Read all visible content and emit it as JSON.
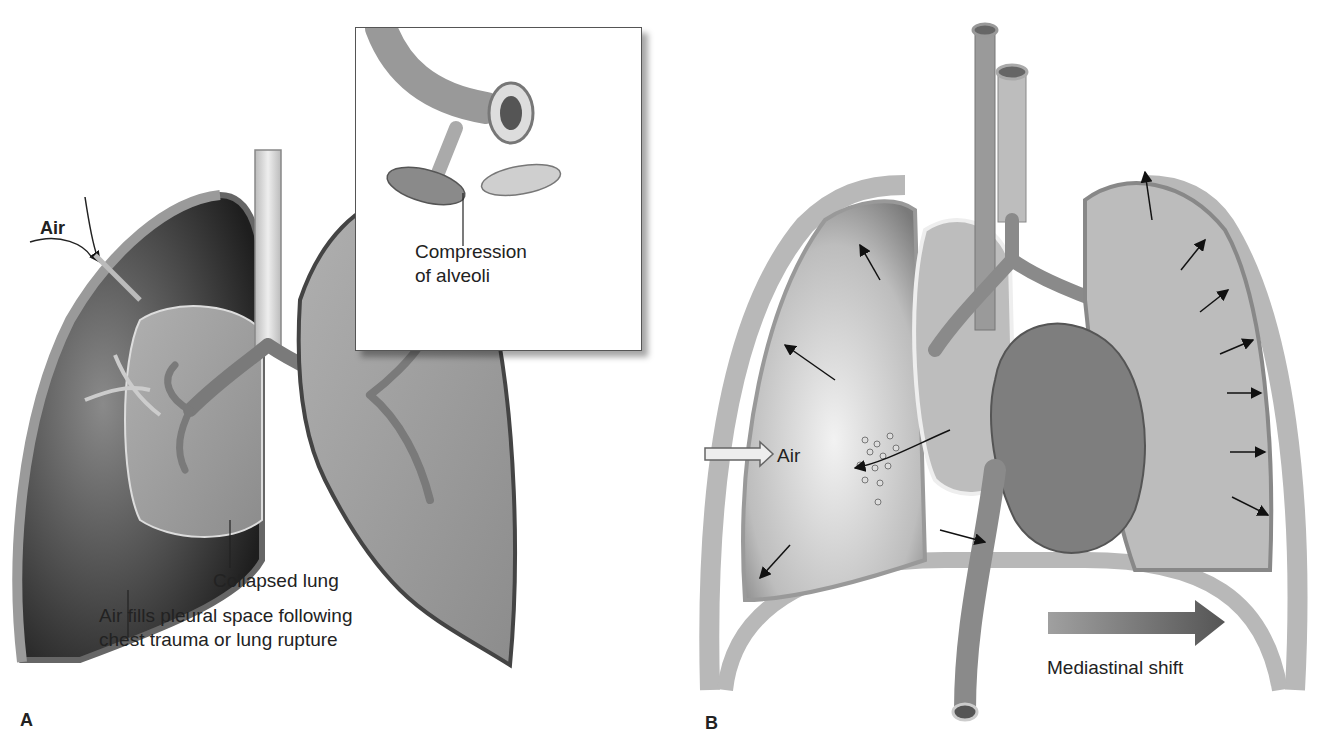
{
  "figure": {
    "panel_a": {
      "letter": "A",
      "labels": {
        "air": "Air",
        "compression_line1": "Compression",
        "compression_line2": "of alveoli",
        "collapsed_lung": "Collapsed lung",
        "air_fills_line1": "Air fills pleural space following",
        "air_fills_line2": "chest trauma or lung rupture"
      }
    },
    "panel_b": {
      "letter": "B",
      "labels": {
        "air": "Air",
        "mediastinal_shift": "Mediastinal shift"
      }
    },
    "colors": {
      "tissue_light": "#c9c9c9",
      "tissue_mid": "#9a9a9a",
      "tissue_dark": "#3a3a3a",
      "outline": "#555555",
      "label_text": "#222222",
      "shift_arrow": "#6e6e6e"
    }
  }
}
